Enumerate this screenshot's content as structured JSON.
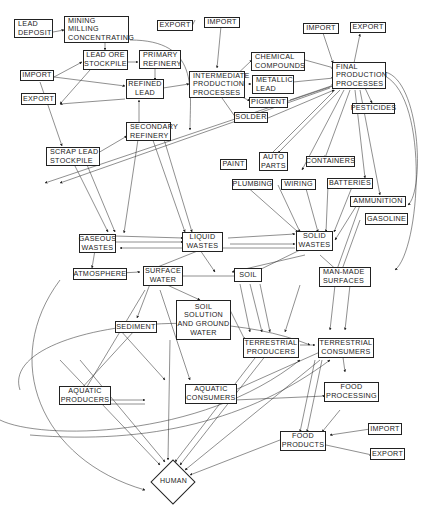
{
  "diagram": {
    "nodes": {
      "lead_deposit": {
        "l1": "LEAD",
        "l2": "DEPOSIT"
      },
      "mining": {
        "l1": "MINING",
        "l2": "MILLING",
        "l3": "CONCENTRATING"
      },
      "lead_ore": {
        "l1": "LEAD ORE",
        "l2": "STOCKPILE"
      },
      "primary_refinery": {
        "l1": "PRIMARY",
        "l2": "REFINERY"
      },
      "import_left": {
        "l1": "IMPORT"
      },
      "refined_lead": {
        "l1": "REFINED",
        "l2": "LEAD"
      },
      "export_left": {
        "l1": "EXPORT"
      },
      "export_top": {
        "l1": "EXPORT"
      },
      "import_top": {
        "l1": "IMPORT"
      },
      "intermediate": {
        "l1": "INTERMEDIATE",
        "l2": "PRODUCTION",
        "l3": "PROCESSES"
      },
      "chemical": {
        "l1": "CHEMICAL",
        "l2": "COMPOUNDS"
      },
      "metallic": {
        "l1": "METALLIC",
        "l2": "LEAD"
      },
      "pigment": {
        "l1": "PIGMENT"
      },
      "solder": {
        "l1": "SOLDER"
      },
      "import_right": {
        "l1": "IMPORT"
      },
      "export_right": {
        "l1": "EXPORT"
      },
      "final": {
        "l1": "FINAL",
        "l2": "PRODUCTION",
        "l3": "PROCESSES"
      },
      "pesticides": {
        "l1": "PESTICIDES"
      },
      "secondary": {
        "l1": "SECONDARY",
        "l2": "REFINERY"
      },
      "scrap": {
        "l1": "SCRAP LEAD",
        "l2": "STOCKPILE"
      },
      "paint": {
        "l1": "PAINT"
      },
      "auto_parts": {
        "l1": "AUTO",
        "l2": "PARTS"
      },
      "containers": {
        "l1": "CONTAINERS"
      },
      "plumbing": {
        "l1": "PLUMBING"
      },
      "wiring": {
        "l1": "WIRING"
      },
      "batteries": {
        "l1": "BATTERIES"
      },
      "ammunition": {
        "l1": "AMMUNITION"
      },
      "gasoline": {
        "l1": "GASOLINE"
      },
      "gaseous": {
        "l1": "GASEOUS",
        "l2": "WASTES"
      },
      "liquid": {
        "l1": "LIQUID",
        "l2": "WASTES"
      },
      "solid": {
        "l1": "SOLID",
        "l2": "WASTES"
      },
      "atmosphere": {
        "l1": "ATMOSPHERE"
      },
      "surface_water": {
        "l1": "SURFACE",
        "l2": "WATER"
      },
      "soil": {
        "l1": "SOIL"
      },
      "man_made": {
        "l1": "MAN-MADE",
        "l2": "SURFACES"
      },
      "soil_solution": {
        "l1": "SOIL",
        "l2": "SOLUTION",
        "l3": "AND GROUND",
        "l4": "WATER"
      },
      "sediment": {
        "l1": "SEDIMENT"
      },
      "terr_producers": {
        "l1": "TERRESTRIAL",
        "l2": "PRODUCERS"
      },
      "terr_consumers": {
        "l1": "TERRESTRIAL",
        "l2": "CONSUMERS"
      },
      "aquatic_producers": {
        "l1": "AQUATIC",
        "l2": "PRODUCERS"
      },
      "aquatic_consumers": {
        "l1": "AQUATIC",
        "l2": "CONSUMERS"
      },
      "food_processing": {
        "l1": "FOOD",
        "l2": "PROCESSING"
      },
      "food_products": {
        "l1": "FOOD",
        "l2": "PRODUCTS"
      },
      "import_bottom": {
        "l1": "IMPORT"
      },
      "export_bottom": {
        "l1": "EXPORT"
      },
      "human": {
        "l1": "HUMAN"
      }
    }
  }
}
